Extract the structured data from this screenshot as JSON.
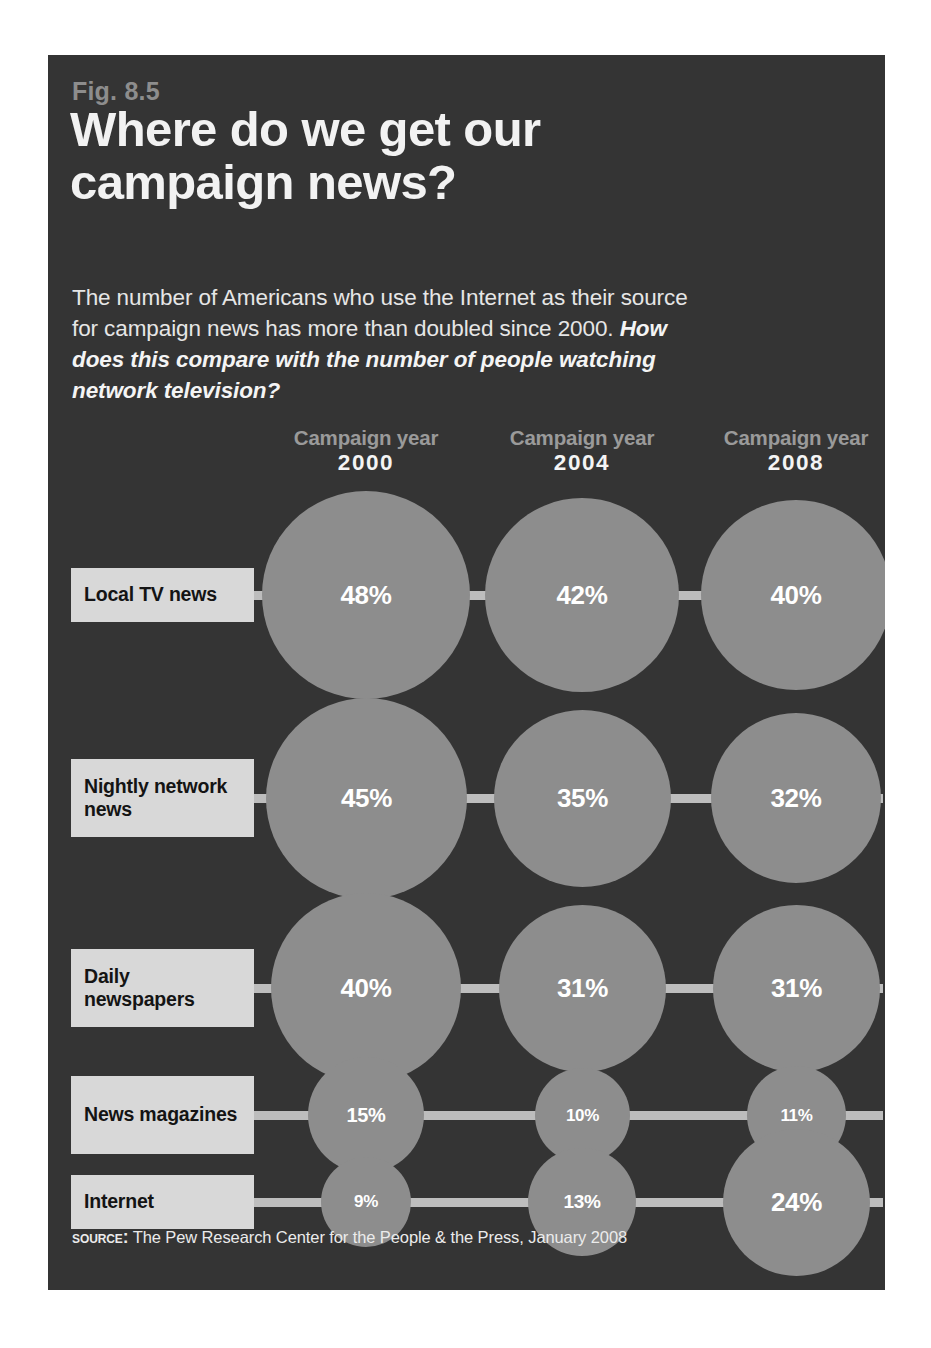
{
  "figure": {
    "number": "Fig. 8.5",
    "title": "Where do we get our campaign news?",
    "subtitle_plain": "The number of Americans who use the Internet as their source for campaign news has more than doubled since 2000.",
    "subtitle_emphasis": "How does this compare with the number of people watching network television?",
    "source_kicker": "Source:",
    "source_text": "The Pew Research Center for the People & the Press, January 2008"
  },
  "colors": {
    "panel_background": "#343434",
    "bubble": "#8d8d8d",
    "connector": "#bdbdbd",
    "row_label_background": "#d8d8d8",
    "row_label_text": "#141414",
    "title_text": "#f2f2f2",
    "fig_number_text": "#8d8d8d",
    "column_caption_text": "#9a9a9a",
    "column_year_text": "#f4f4f4",
    "value_text": "#ffffff"
  },
  "columns": [
    {
      "caption": "Campaign year",
      "year": "2000"
    },
    {
      "caption": "Campaign year",
      "year": "2004"
    },
    {
      "caption": "Campaign year",
      "year": "2008"
    }
  ],
  "rows": [
    {
      "label": "Local TV news",
      "values": [
        "48%",
        "42%",
        "40%"
      ]
    },
    {
      "label": "Nightly network news",
      "values": [
        "45%",
        "35%",
        "32%"
      ]
    },
    {
      "label": "Daily newspapers",
      "values": [
        "40%",
        "31%",
        "31%"
      ]
    },
    {
      "label": "News magazines",
      "values": [
        "15%",
        "10%",
        "11%"
      ]
    },
    {
      "label": "Internet",
      "values": [
        "9%",
        "13%",
        "24%"
      ]
    }
  ],
  "chart_data": {
    "type": "bubble",
    "title": "Where do we get our campaign news?",
    "subtitle": "The number of Americans who use the Internet as their source for campaign news has more than doubled since 2000. How does this compare with the number of people watching network television?",
    "xlabel": "Campaign year",
    "ylabel": "News source",
    "unit": "percent",
    "categories": [
      "2000",
      "2004",
      "2008"
    ],
    "series": [
      {
        "name": "Local TV news",
        "values": [
          48,
          42,
          40
        ]
      },
      {
        "name": "Nightly network news",
        "values": [
          45,
          35,
          32
        ]
      },
      {
        "name": "Daily newspapers",
        "values": [
          40,
          31,
          31
        ]
      },
      {
        "name": "News magazines",
        "values": [
          15,
          10,
          11
        ]
      },
      {
        "name": "Internet",
        "values": [
          9,
          13,
          24
        ]
      }
    ],
    "legend": "none",
    "grid": false,
    "annotations": [
      "Fig. 8.5"
    ],
    "source": "Source: The Pew Research Center for the People & the Press, January 2008"
  },
  "layout": {
    "column_centers_px": [
      318,
      534,
      748
    ],
    "row_centers_px": [
      540,
      743,
      933,
      1060,
      1147
    ],
    "bubble_scale_px_per_sqrt_pct": 30.0
  }
}
